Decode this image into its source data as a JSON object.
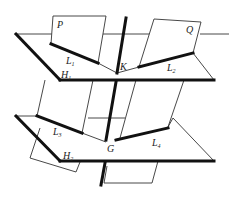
{
  "diagram": {
    "type": "3D geometry: two parallel planes intersected by two planes and a line",
    "labels": {
      "plane_p": "P",
      "plane_q": "Q",
      "point_k": "K",
      "point_g": "G",
      "line_l1": "L",
      "line_l1_sub": "1",
      "line_l2": "L",
      "line_l2_sub": "2",
      "line_l3": "L",
      "line_l3_sub": "3",
      "line_l4": "L",
      "line_l4_sub": "4",
      "plane_h1": "H",
      "plane_h1_sub": "1",
      "plane_h2": "H",
      "plane_h2_sub": "2"
    },
    "colors": {
      "line": "#111111",
      "thin_line": "#333333",
      "background": "#ffffff"
    }
  }
}
